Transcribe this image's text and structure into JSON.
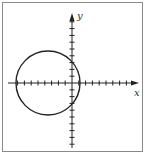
{
  "diagram": {
    "type": "coordinate-plane-with-circle",
    "axes": {
      "x_label": "x",
      "y_label": "y",
      "origin_px": [
        72,
        83
      ],
      "tick_spacing_px": 6.8,
      "x_ticks_left": 8,
      "x_ticks_right": 8,
      "y_ticks_up": 9,
      "y_ticks_down": 9
    },
    "circle": {
      "center_units": [
        -3.5,
        0
      ],
      "radius_units": 4.7,
      "center_px": [
        48,
        83
      ],
      "radius_px": 32
    },
    "colors": {
      "stroke": "#222222",
      "frame": "#8a8a8a",
      "background": "#ffffff"
    }
  }
}
